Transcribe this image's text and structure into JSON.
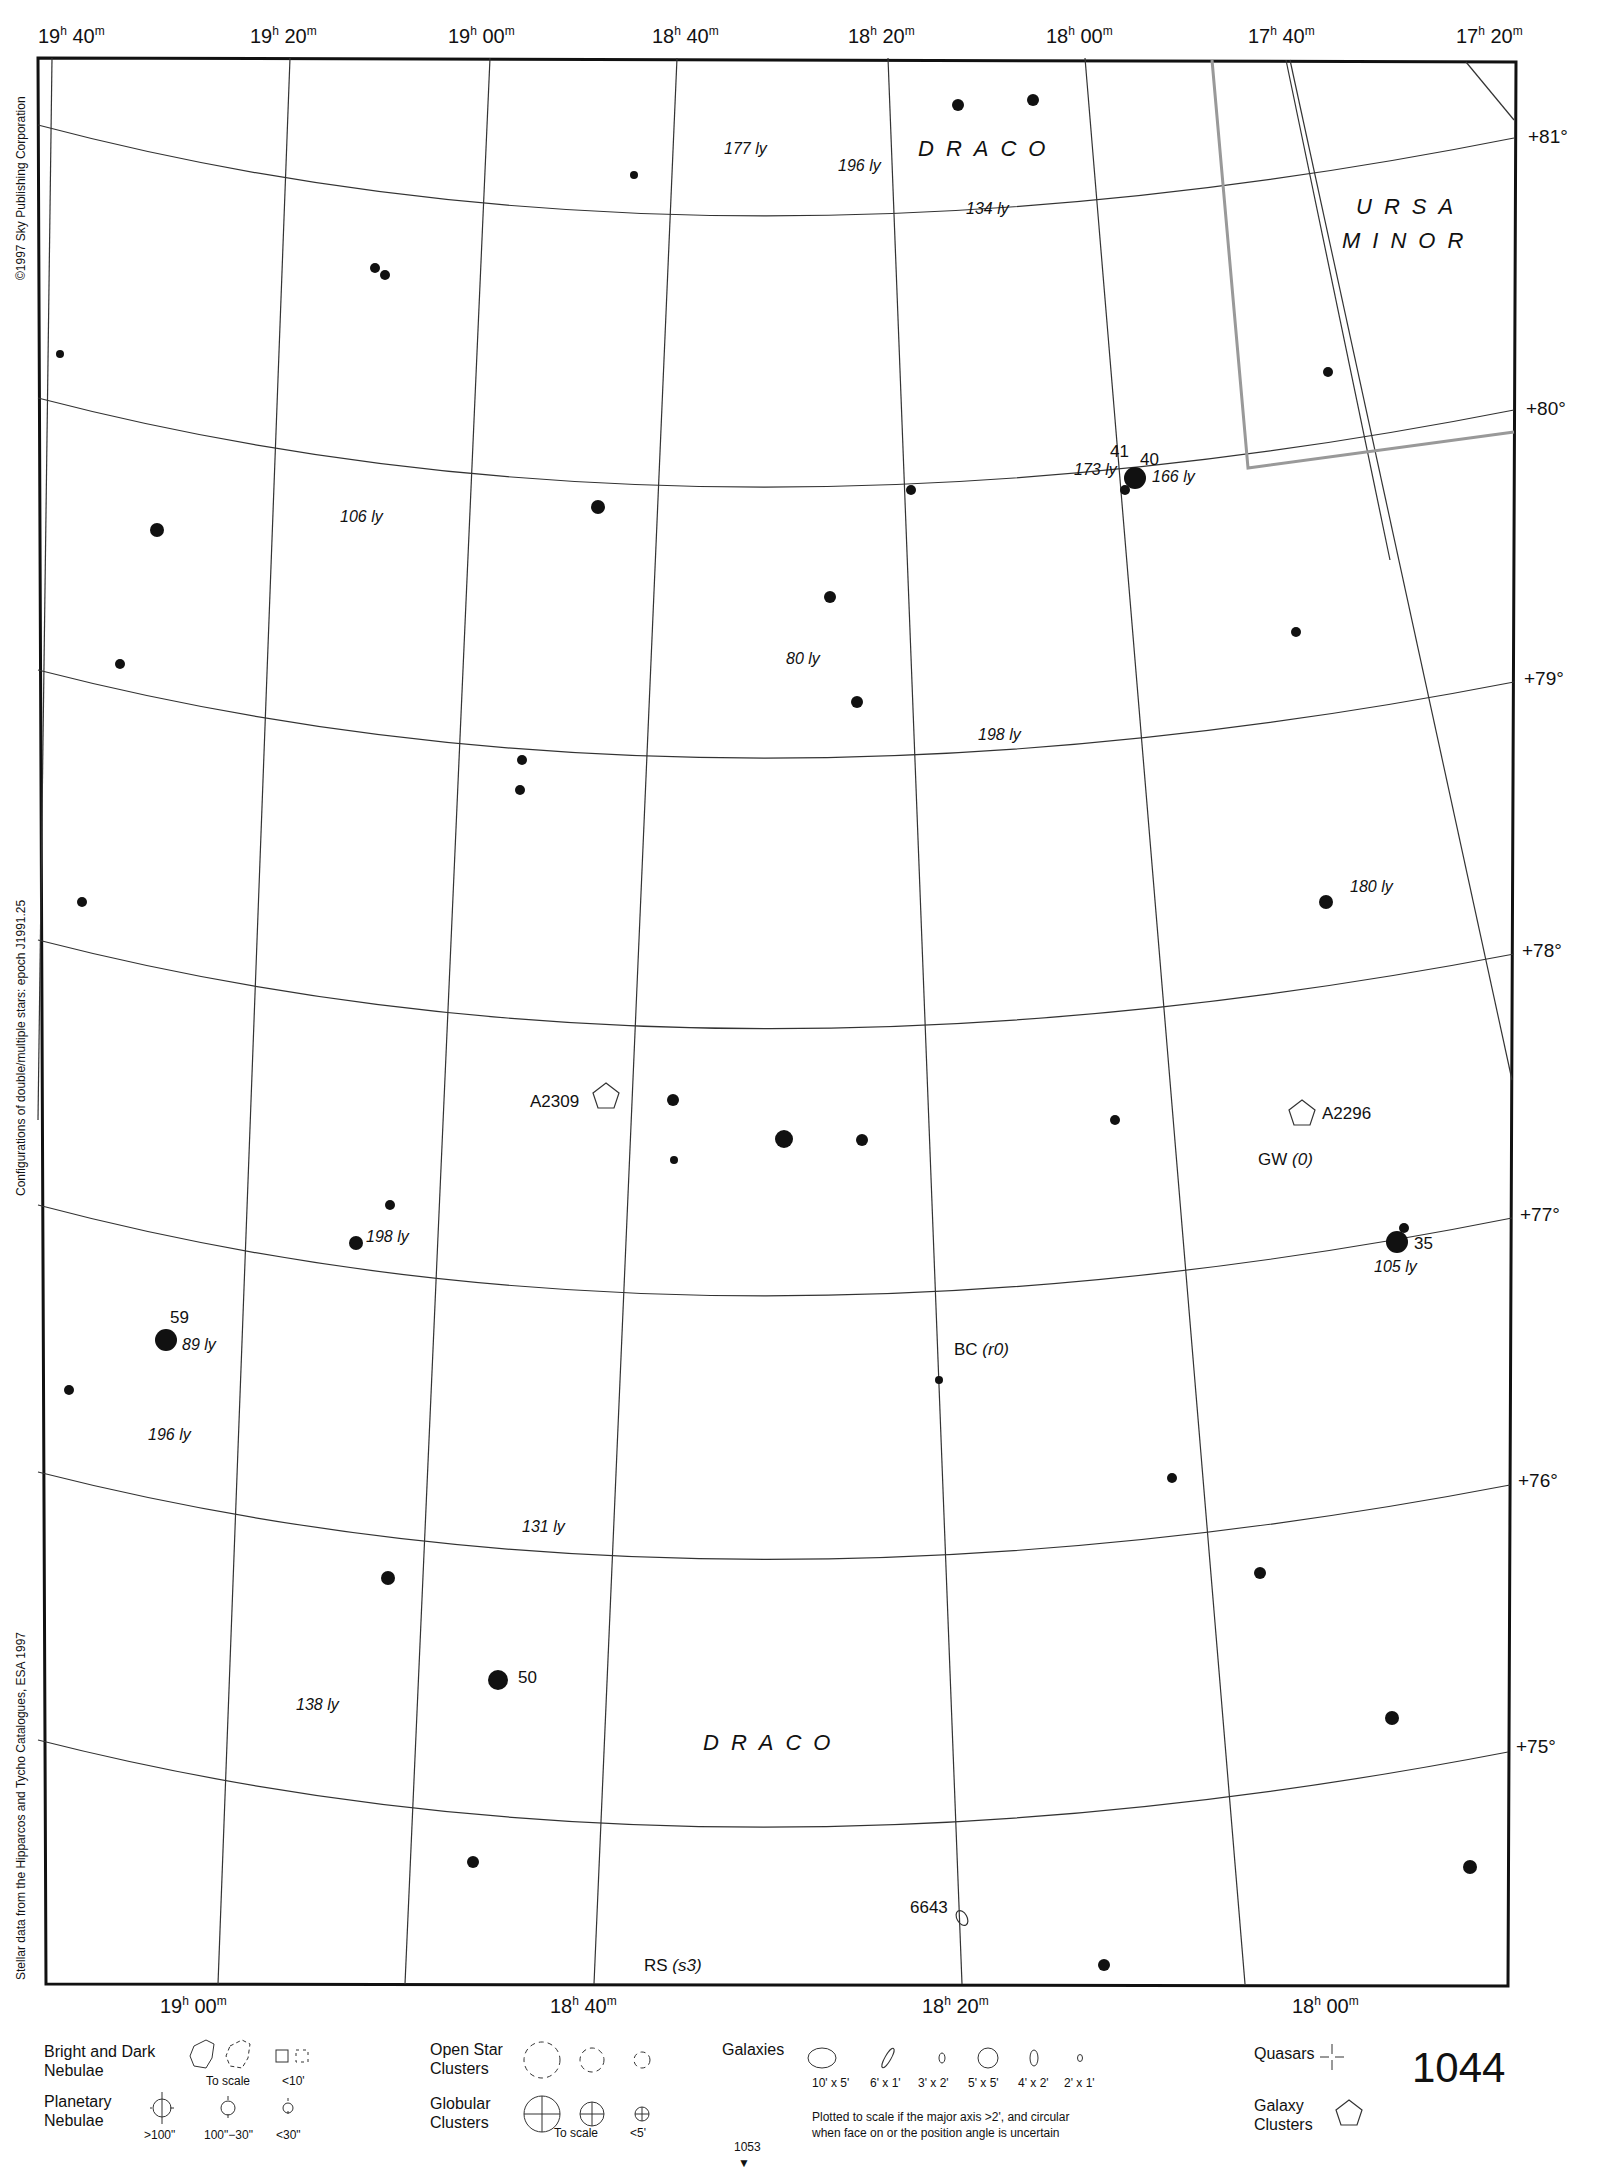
{
  "chart": {
    "ra_top": [
      {
        "h": "19",
        "m": "40",
        "x": 38
      },
      {
        "h": "19",
        "m": "20",
        "x": 250
      },
      {
        "h": "19",
        "m": "00",
        "x": 448
      },
      {
        "h": "18",
        "m": "40",
        "x": 652
      },
      {
        "h": "18",
        "m": "20",
        "x": 848
      },
      {
        "h": "18",
        "m": "00",
        "x": 1046
      },
      {
        "h": "17",
        "m": "40",
        "x": 1248
      },
      {
        "h": "17",
        "m": "20",
        "x": 1456
      }
    ],
    "ra_bottom": [
      {
        "h": "19",
        "m": "00",
        "x": 160
      },
      {
        "h": "18",
        "m": "40",
        "x": 550
      },
      {
        "h": "18",
        "m": "20",
        "x": 922
      },
      {
        "h": "18",
        "m": "00",
        "x": 1292
      }
    ],
    "dec": [
      {
        "label": "+81°",
        "y": 138
      },
      {
        "label": "+80°",
        "y": 410
      },
      {
        "label": "+79°",
        "y": 680
      },
      {
        "label": "+78°",
        "y": 952
      },
      {
        "label": "+77°",
        "y": 1216
      },
      {
        "label": "+76°",
        "y": 1482
      },
      {
        "label": "+75°",
        "y": 1748
      }
    ],
    "side_texts": {
      "copyright": "©1997 Sky Publishing Corporation",
      "configurations": "Configurations of double/multiple stars: epoch J1991.25",
      "stellar_data": "Stellar data from the Hipparcos and Tycho Catalogues, ESA 1997"
    },
    "constellations": [
      {
        "name": "DRACO",
        "x": 918,
        "y": 140
      },
      {
        "name": "URSA",
        "x": 1356,
        "y": 196
      },
      {
        "name": "MINOR",
        "x": 1342,
        "y": 230
      },
      {
        "name": "DRACO",
        "x": 703,
        "y": 1732
      }
    ],
    "star_labels": [
      {
        "text": "41",
        "x": 1110,
        "y": 442
      },
      {
        "text": "40",
        "x": 1140,
        "y": 450
      },
      {
        "text": "59",
        "x": 170,
        "y": 1315
      },
      {
        "text": "35",
        "x": 1414,
        "y": 1238
      },
      {
        "text": "50",
        "x": 518,
        "y": 1672
      }
    ],
    "distance_labels": [
      {
        "text": "177 ly",
        "x": 724,
        "y": 140
      },
      {
        "text": "196 ly",
        "x": 838,
        "y": 157
      },
      {
        "text": "134 ly",
        "x": 966,
        "y": 200
      },
      {
        "text": "173 ly",
        "x": 1074,
        "y": 461
      },
      {
        "text": "166 ly",
        "x": 1152,
        "y": 468
      },
      {
        "text": "106 ly",
        "x": 340,
        "y": 508
      },
      {
        "text": "80 ly",
        "x": 786,
        "y": 650
      },
      {
        "text": "198 ly",
        "x": 978,
        "y": 726
      },
      {
        "text": "180 ly",
        "x": 1350,
        "y": 878
      },
      {
        "text": "198 ly",
        "x": 366,
        "y": 1228
      },
      {
        "text": "105 ly",
        "x": 1374,
        "y": 1258
      },
      {
        "text": "89 ly",
        "x": 182,
        "y": 1336
      },
      {
        "text": "196 ly",
        "x": 148,
        "y": 1426
      },
      {
        "text": "131 ly",
        "x": 522,
        "y": 1518
      },
      {
        "text": "138 ly",
        "x": 296,
        "y": 1696
      }
    ],
    "object_labels": [
      {
        "text": "A2309",
        "x": 530,
        "y": 1094
      },
      {
        "text": "A2296",
        "x": 1322,
        "y": 1104
      },
      {
        "text": "GW",
        "italic": "(0)",
        "x": 1258,
        "y": 1152
      },
      {
        "text": "BC",
        "italic": "(r0)",
        "x": 954,
        "y": 1342
      },
      {
        "text": "6643",
        "x": 910,
        "y": 1900
      },
      {
        "text": "RS",
        "italic": "(s3)",
        "x": 644,
        "y": 1958
      }
    ]
  },
  "legend": {
    "nebulae": {
      "title": "Bright and Dark\nNebulae",
      "line1": "Bright and Dark",
      "line2": "Nebulae",
      "to_scale": "To scale",
      "small": "<10'"
    },
    "planetary": {
      "line1": "Planetary",
      "line2": "Nebulae",
      "sizes": [
        ">100\"",
        "100\"−30\"",
        "<30\""
      ]
    },
    "open_clusters": {
      "line1": "Open Star",
      "line2": "Clusters"
    },
    "globular": {
      "line1": "Globular",
      "line2": "Clusters",
      "to_scale": "To scale",
      "small": "<5'"
    },
    "galaxies": {
      "title": "Galaxies",
      "sizes": [
        "10' x 5'",
        "6' x 1'",
        "3' x 2'",
        "5' x 5'",
        "4' x 2'",
        "2' x 1'"
      ],
      "note1": "Plotted to scale if the major axis >2', and circular",
      "note2": "when face on or the position angle is uncertain"
    },
    "quasars": {
      "label": "Quasars"
    },
    "galaxy_clusters": {
      "line1": "Galaxy",
      "line2": "Clusters"
    }
  },
  "page": {
    "number": "1044",
    "adjacent_chart": "1053"
  }
}
